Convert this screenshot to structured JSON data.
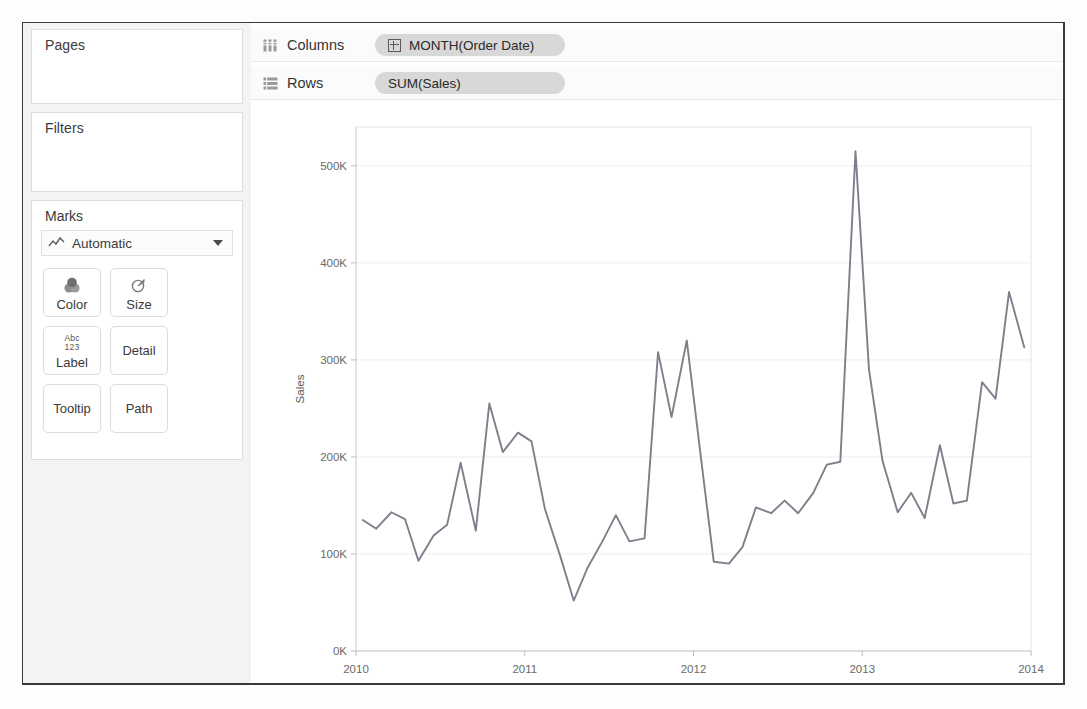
{
  "panel": {
    "pages_label": "Pages",
    "filters_label": "Filters",
    "marks_label": "Marks",
    "marks_type": "Automatic",
    "marks_type_icon": "line-chart-icon",
    "dropdown_icon": "chevron-down-icon",
    "buttons": [
      {
        "label": "Color",
        "icon": "color-circles-icon"
      },
      {
        "label": "Size",
        "icon": "size-circle-icon"
      },
      {
        "label": "Label",
        "icon": "abc123-icon",
        "icon_text_top": "Abc",
        "icon_text_bottom": "123"
      },
      {
        "label": "Detail",
        "icon": ""
      },
      {
        "label": "Tooltip",
        "icon": ""
      },
      {
        "label": "Path",
        "icon": ""
      }
    ]
  },
  "shelves": {
    "columns": {
      "label": "Columns",
      "icon": "columns-icon",
      "pill": "MONTH(Order Date)",
      "pill_icon": "plus-box-icon"
    },
    "rows": {
      "label": "Rows",
      "icon": "rows-icon",
      "pill": "SUM(Sales)"
    }
  },
  "chart_data": {
    "type": "line",
    "title": "",
    "xlabel": "Month of Order Date",
    "ylabel": "Sales",
    "x_tick_labels": [
      "2010",
      "2011",
      "2012",
      "2013",
      "2014"
    ],
    "x_tick_values": [
      2010,
      2011,
      2012,
      2013,
      2014
    ],
    "y_tick_labels": [
      "0K",
      "100K",
      "200K",
      "300K",
      "400K",
      "500K"
    ],
    "y_tick_values": [
      0,
      100000,
      200000,
      300000,
      400000,
      500000
    ],
    "ylim": [
      0,
      540000
    ],
    "xlim": [
      2010.0,
      2014.0
    ],
    "grid": true,
    "legend": "none",
    "line_color": "#7b808a",
    "series": [
      {
        "name": "SUM(Sales)",
        "x": [
          2010.04,
          2010.12,
          2010.21,
          2010.29,
          2010.37,
          2010.46,
          2010.54,
          2010.62,
          2010.71,
          2010.79,
          2010.87,
          2010.96,
          2011.04,
          2011.12,
          2011.21,
          2011.29,
          2011.37,
          2011.46,
          2011.54,
          2011.62,
          2011.71,
          2011.79,
          2011.87,
          2011.96,
          2012.04,
          2012.12,
          2012.21,
          2012.29,
          2012.37,
          2012.46,
          2012.54,
          2012.62,
          2012.71,
          2012.79,
          2012.87,
          2012.96,
          2013.04,
          2013.12,
          2013.21,
          2013.29,
          2013.37,
          2013.46,
          2013.54,
          2013.62,
          2013.71,
          2013.79,
          2013.87,
          2013.96
        ],
        "values": [
          135000,
          126000,
          143000,
          136000,
          93000,
          119000,
          130000,
          194000,
          124000,
          255000,
          205000,
          225000,
          216000,
          146000,
          98000,
          52000,
          85000,
          113000,
          140000,
          113000,
          116000,
          308000,
          241000,
          320000,
          205000,
          92000,
          90000,
          107000,
          148000,
          142000,
          155000,
          142000,
          163000,
          192000,
          195000,
          515000,
          290000,
          196000,
          143000,
          163000,
          137000,
          212000,
          152000,
          155000,
          277000,
          260000,
          370000,
          313000
        ]
      }
    ]
  }
}
